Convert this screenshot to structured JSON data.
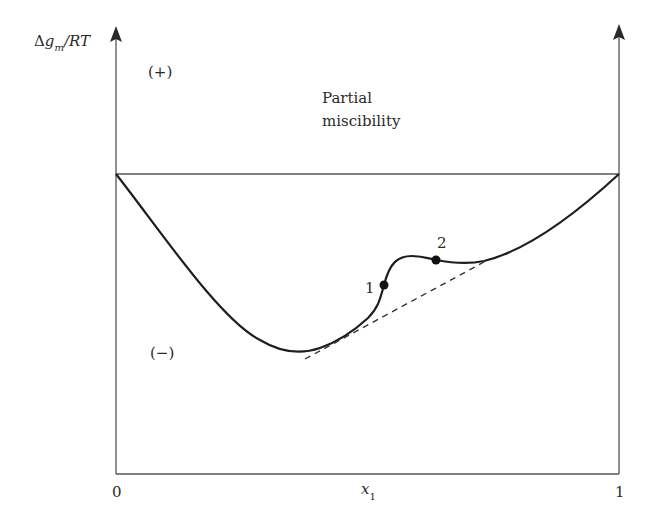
{
  "diagram": {
    "y_axis_label": {
      "prefix": "Δ",
      "var": "g",
      "sub": "m",
      "suffix": "/RT"
    },
    "x_axis_label": {
      "var": "x",
      "sub": "1"
    },
    "x_ticks": {
      "left": "0",
      "right": "1"
    },
    "positive_region": "(+)",
    "negative_region": "(−)",
    "annotation_line1": "Partial",
    "annotation_line2": "miscibility",
    "points": [
      {
        "label": "1",
        "x": 384,
        "y": 285
      },
      {
        "label": "2",
        "x": 436,
        "y": 260
      }
    ],
    "colors": {
      "line": "#2a2a2a",
      "axis": "#555555"
    }
  }
}
